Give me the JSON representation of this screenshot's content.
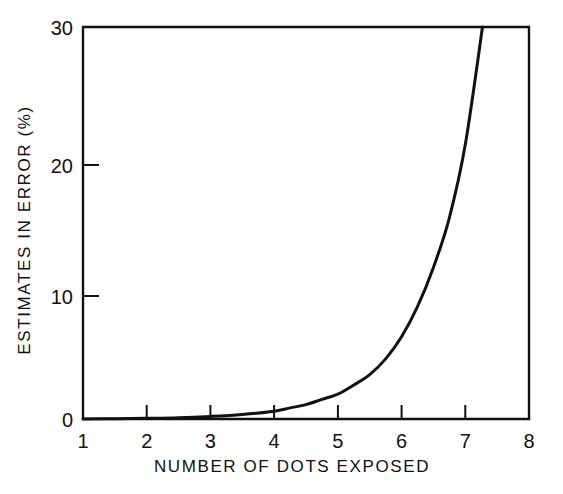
{
  "chart_data": {
    "type": "line",
    "title": "",
    "xlabel": "NUMBER OF DOTS EXPOSED",
    "ylabel": "ESTIMATES IN ERROR (%)",
    "xlim": [
      1,
      8
    ],
    "ylim": [
      0,
      30
    ],
    "xticks": [
      1,
      2,
      3,
      4,
      5,
      6,
      7,
      8
    ],
    "xticklabels": [
      "1",
      "2",
      "3",
      "4",
      "5",
      "6",
      "7",
      "8"
    ],
    "yticks": [
      0,
      10,
      20,
      30
    ],
    "yticklabels": [
      "0",
      "10",
      "20",
      "30"
    ],
    "grid": false,
    "legend": false,
    "legend_position": "none",
    "line_color": "#111111",
    "background_color": "#ffffff",
    "series": [
      {
        "name": "estimates in error",
        "x": [
          1.0,
          1.5,
          2.0,
          2.5,
          3.0,
          3.5,
          4.0,
          4.25,
          4.5,
          4.75,
          5.0,
          5.25,
          5.5,
          5.75,
          6.0,
          6.25,
          6.5,
          6.75,
          7.0,
          7.27
        ],
        "values": [
          0.0,
          0.02,
          0.05,
          0.1,
          0.2,
          0.35,
          0.6,
          0.85,
          1.1,
          1.5,
          1.9,
          2.6,
          3.4,
          4.6,
          6.3,
          8.6,
          11.6,
          15.4,
          21.0,
          30.0
        ]
      }
    ],
    "annotations": []
  },
  "axis_labels": {
    "x_title": "NUMBER OF DOTS EXPOSED",
    "y_title": "ESTIMATES IN ERROR (%)"
  },
  "ticks": {
    "x": [
      {
        "label": "1",
        "value": 1
      },
      {
        "label": "2",
        "value": 2
      },
      {
        "label": "3",
        "value": 3
      },
      {
        "label": "4",
        "value": 4
      },
      {
        "label": "5",
        "value": 5
      },
      {
        "label": "6",
        "value": 6
      },
      {
        "label": "7",
        "value": 7
      },
      {
        "label": "8",
        "value": 8
      }
    ],
    "y": [
      {
        "label": "0",
        "value": 0
      },
      {
        "label": "10",
        "value": 10
      },
      {
        "label": "20",
        "value": 20
      },
      {
        "label": "30",
        "value": 30
      }
    ]
  }
}
